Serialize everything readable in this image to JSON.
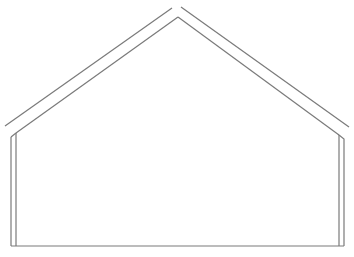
{
  "diagram": {
    "stroke_color": "#7a7a7a",
    "background": "#ffffff",
    "outer_roof": {
      "left_line": {
        "x1": 5,
        "y1": 126,
        "x2": 172,
        "y2": 8
      },
      "right_line": {
        "x1": 181,
        "y1": 7,
        "x2": 349,
        "y2": 127
      }
    },
    "inner_roof": {
      "left_line": {
        "x1": 16,
        "y1": 133,
        "x2": 178,
        "y2": 17
      },
      "right_line": {
        "x1": 178,
        "y1": 17,
        "x2": 339,
        "y2": 135
      }
    },
    "walls": {
      "left_outer_x": 11,
      "left_inner_x": 16,
      "right_inner_x": 339,
      "right_outer_x": 344,
      "bottom_y": 246
    }
  }
}
